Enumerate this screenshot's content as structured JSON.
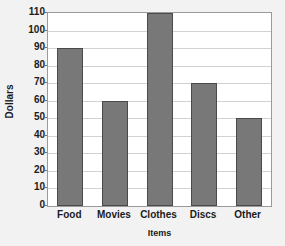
{
  "chart_data": {
    "type": "bar",
    "title": "",
    "xlabel": "Items",
    "ylabel": "Dollars",
    "categories": [
      "Food",
      "Movies",
      "Clothes",
      "Discs",
      "Other"
    ],
    "values": [
      90,
      60,
      110,
      70,
      50
    ],
    "ylim": [
      0,
      110
    ],
    "ytick_step": 10,
    "yticks": [
      0,
      10,
      20,
      30,
      40,
      50,
      60,
      70,
      80,
      90,
      100,
      110
    ],
    "ytick_labels": [
      "0",
      "10",
      "20",
      "30",
      "40",
      "50",
      "60",
      "70",
      "80",
      "90",
      "100",
      "110"
    ],
    "grid": true,
    "legend": false,
    "legend_position": "none",
    "series": [
      {
        "name": "Dollars",
        "values": [
          90,
          60,
          110,
          70,
          50
        ]
      }
    ],
    "colors": {
      "bar_fill": "#787878",
      "bar_border": "#4a4a4a",
      "plot_background": "#ffffff",
      "figure_background": "#f2f2f2",
      "gridline": "#d2d2d2",
      "frame": "#9a9a9a",
      "text": "#1b1b1b"
    }
  }
}
